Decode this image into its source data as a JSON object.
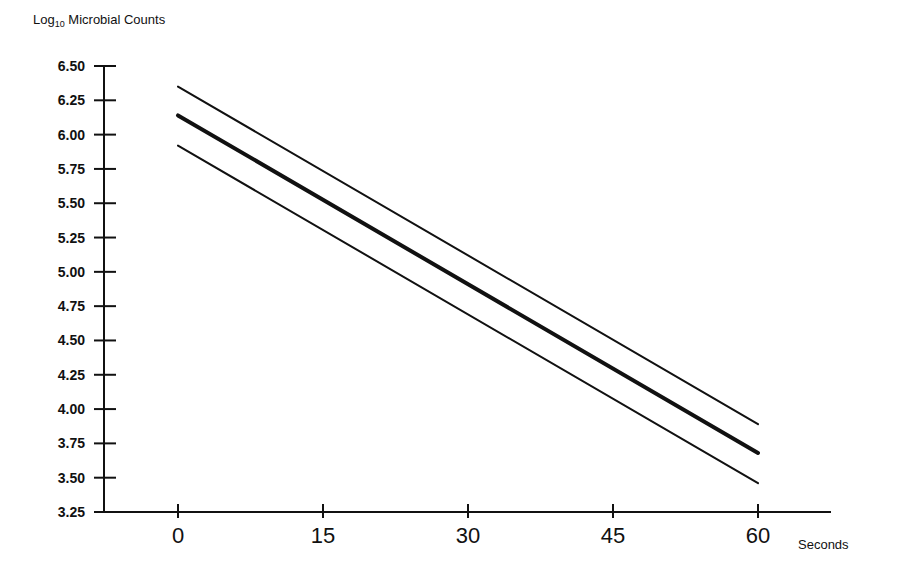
{
  "chart_data": {
    "type": "line",
    "title": "Log10 Microbial Counts",
    "title_parts": {
      "prefix": "Log",
      "subscript": "10",
      "suffix": " Microbial Counts"
    },
    "xlabel": "Seconds",
    "ylabel": "Log10 Microbial Counts",
    "x": [
      0,
      15,
      30,
      45,
      60
    ],
    "xticks": [
      0,
      15,
      30,
      45,
      60
    ],
    "xtick_labels": [
      "0",
      "15",
      "30",
      "45",
      "60"
    ],
    "yticks": [
      3.25,
      3.5,
      3.75,
      4.0,
      4.25,
      4.5,
      4.75,
      5.0,
      5.25,
      5.5,
      5.75,
      6.0,
      6.25,
      6.5
    ],
    "ytick_labels": [
      "3.25",
      "3.50",
      "3.75",
      "4.00",
      "4.25",
      "4.50",
      "4.75",
      "5.00",
      "5.25",
      "5.50",
      "5.75",
      "6.00",
      "6.25",
      "6.50"
    ],
    "ylim": [
      3.25,
      6.5
    ],
    "xlim": [
      -5,
      70
    ],
    "grid": false,
    "legend": null,
    "series": [
      {
        "name": "Upper confidence limit",
        "style": "thin",
        "x": [
          0,
          60
        ],
        "values": [
          6.35,
          3.89
        ]
      },
      {
        "name": "Regression line",
        "style": "thick",
        "x": [
          0,
          60
        ],
        "values": [
          6.14,
          3.68
        ]
      },
      {
        "name": "Lower confidence limit",
        "style": "thin",
        "x": [
          0,
          60
        ],
        "values": [
          5.92,
          3.46
        ]
      }
    ]
  }
}
